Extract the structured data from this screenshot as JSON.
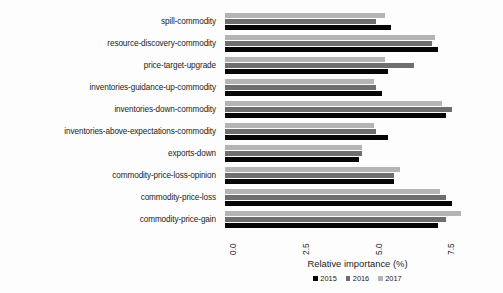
{
  "chart_data": {
    "type": "bar",
    "orientation": "horizontal",
    "title": "",
    "xlabel": "Relative importance (%)",
    "ylabel": "",
    "xlim": [
      0.0,
      9.1
    ],
    "xticks": [
      "0.0",
      "2.5",
      "5.0",
      "7.5"
    ],
    "xtick_values": [
      0.0,
      2.5,
      5.0,
      7.5
    ],
    "grid": false,
    "legend_position": "bottom",
    "categories": [
      "spill-commodity",
      "resource-discovery-commodity",
      "price-target-upgrade",
      "inventories-guidance-up-commodity",
      "inventories-down-commodity",
      "inventories-above-expectations-commodity",
      "exports-down",
      "commodity-price-loss-opinion",
      "commodity-price-loss",
      "commodity-price-gain"
    ],
    "series": [
      {
        "name": "2015",
        "color": "#050505",
        "values": [
          5.7,
          7.3,
          5.6,
          5.4,
          7.6,
          5.6,
          4.6,
          5.8,
          7.8,
          7.3
        ]
      },
      {
        "name": "2016",
        "color": "#6e6e6e",
        "values": [
          5.2,
          7.1,
          6.5,
          5.2,
          7.8,
          5.2,
          4.7,
          5.8,
          7.6,
          7.6
        ]
      },
      {
        "name": "2017",
        "color": "#b4b4b4",
        "values": [
          5.5,
          7.2,
          5.5,
          5.1,
          7.45,
          5.1,
          4.7,
          6.0,
          7.4,
          8.1
        ]
      }
    ]
  },
  "legend": {
    "items": [
      {
        "label": "2015",
        "color": "#050505"
      },
      {
        "label": "2016",
        "color": "#6e6e6e"
      },
      {
        "label": "2017",
        "color": "#b4b4b4"
      }
    ]
  }
}
